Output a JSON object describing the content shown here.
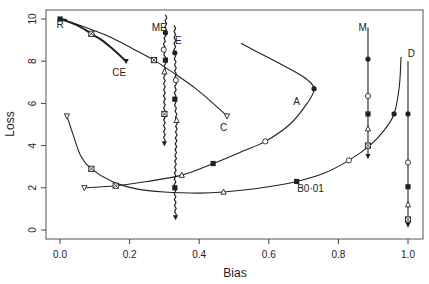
{
  "chart_data": {
    "type": "line",
    "title": "",
    "xlabel": "Bias",
    "ylabel": "Loss",
    "xlim": [
      -0.03,
      1.02
    ],
    "ylim": [
      -0.3,
      10.4
    ],
    "xticks": [
      "0.0",
      "0.2",
      "0.4",
      "0.6",
      "0.8",
      "1.0"
    ],
    "xtick_values": [
      0.0,
      0.2,
      0.4,
      0.6,
      0.8,
      1.0
    ],
    "yticks": [
      "0",
      "2",
      "4",
      "6",
      "8",
      "10"
    ],
    "ytick_values": [
      0,
      2,
      4,
      6,
      8,
      10
    ],
    "grid": false,
    "legend": "none (curves labelled inline)",
    "series": [
      {
        "name": "R",
        "label_pos": [
          0.0,
          9.75
        ],
        "points": [
          [
            0.0,
            10.0
          ],
          [
            0.01,
            9.98
          ],
          [
            0.02,
            9.95
          ]
        ]
      },
      {
        "name": "CE",
        "label_pos": [
          0.17,
          7.5
        ],
        "points": [
          [
            0.0,
            10.0
          ],
          [
            0.05,
            9.7
          ],
          [
            0.09,
            9.3
          ],
          [
            0.12,
            9.0
          ],
          [
            0.15,
            8.6
          ],
          [
            0.19,
            8.0
          ]
        ]
      },
      {
        "name": "C",
        "label_pos": [
          0.47,
          4.9
        ],
        "points": [
          [
            0.0,
            10.0
          ],
          [
            0.04,
            9.8
          ],
          [
            0.09,
            9.5
          ],
          [
            0.15,
            9.1
          ],
          [
            0.22,
            8.5
          ],
          [
            0.27,
            8.05
          ],
          [
            0.33,
            7.4
          ],
          [
            0.39,
            6.7
          ],
          [
            0.44,
            6.0
          ],
          [
            0.48,
            5.4
          ]
        ]
      },
      {
        "name": "ME",
        "label_pos": [
          0.285,
          9.6
        ],
        "points": [
          [
            0.305,
            10.2
          ],
          [
            0.303,
            9.35
          ],
          [
            0.298,
            8.55
          ],
          [
            0.303,
            8.05
          ],
          [
            0.3,
            7.5
          ],
          [
            0.3,
            5.5
          ],
          [
            0.3,
            4.1
          ]
        ]
      },
      {
        "name": "E",
        "label_pos": [
          0.34,
          9.0
        ],
        "points": [
          [
            0.33,
            9.7
          ],
          [
            0.33,
            8.4
          ],
          [
            0.333,
            7.1
          ],
          [
            0.33,
            6.2
          ],
          [
            0.335,
            5.2
          ],
          [
            0.33,
            2.0
          ],
          [
            0.332,
            0.6
          ]
        ]
      },
      {
        "name": "A",
        "label_pos": [
          0.68,
          6.1
        ],
        "points": [
          [
            0.07,
            2.0
          ],
          [
            0.16,
            2.1
          ],
          [
            0.25,
            2.3
          ],
          [
            0.35,
            2.6
          ],
          [
            0.44,
            3.15
          ],
          [
            0.52,
            3.7
          ],
          [
            0.59,
            4.2
          ],
          [
            0.66,
            5.0
          ],
          [
            0.71,
            6.0
          ],
          [
            0.73,
            6.7
          ],
          [
            0.7,
            7.25
          ],
          [
            0.63,
            7.9
          ],
          [
            0.56,
            8.5
          ],
          [
            0.52,
            8.85
          ]
        ]
      },
      {
        "name": "B0·01",
        "label_pos": [
          0.72,
          2.0
        ],
        "points": [
          [
            0.02,
            5.4
          ],
          [
            0.04,
            4.4
          ],
          [
            0.06,
            3.5
          ],
          [
            0.09,
            2.9
          ],
          [
            0.15,
            2.3
          ],
          [
            0.22,
            1.95
          ],
          [
            0.3,
            1.8
          ],
          [
            0.4,
            1.75
          ],
          [
            0.47,
            1.8
          ],
          [
            0.58,
            2.0
          ],
          [
            0.68,
            2.3
          ],
          [
            0.76,
            2.7
          ],
          [
            0.83,
            3.3
          ],
          [
            0.89,
            4.0
          ],
          [
            0.93,
            4.7
          ],
          [
            0.96,
            5.5
          ],
          [
            0.975,
            6.8
          ],
          [
            0.98,
            8.2
          ]
        ]
      },
      {
        "name": "M",
        "label_pos": [
          0.87,
          9.6
        ],
        "points": [
          [
            0.885,
            9.6
          ],
          [
            0.885,
            8.1
          ],
          [
            0.885,
            6.35
          ],
          [
            0.885,
            5.5
          ],
          [
            0.885,
            4.8
          ],
          [
            0.885,
            4.0
          ],
          [
            0.885,
            3.5
          ]
        ]
      },
      {
        "name": "D",
        "label_pos": [
          1.01,
          8.4
        ],
        "points": [
          [
            1.0,
            8.0
          ],
          [
            1.0,
            5.5
          ],
          [
            1.0,
            3.2
          ],
          [
            1.0,
            2.05
          ],
          [
            1.0,
            1.2
          ],
          [
            1.0,
            0.5
          ],
          [
            1.0,
            0.25
          ]
        ]
      }
    ],
    "markers": [
      {
        "series": "R",
        "shape": "filled-square",
        "x": 0.0,
        "y": 10.0
      },
      {
        "series": "CE",
        "shape": "crossed-square",
        "x": 0.09,
        "y": 9.3
      },
      {
        "series": "CE",
        "shape": "filled-down-triangle",
        "x": 0.19,
        "y": 8.0
      },
      {
        "series": "C",
        "shape": "crossed-square",
        "x": 0.27,
        "y": 8.05
      },
      {
        "series": "C",
        "shape": "open-down-triangle",
        "x": 0.48,
        "y": 5.4
      },
      {
        "series": "ME",
        "shape": "filled-circle",
        "x": 0.303,
        "y": 9.35
      },
      {
        "series": "ME",
        "shape": "open-circle",
        "x": 0.298,
        "y": 8.55
      },
      {
        "series": "ME",
        "shape": "filled-square",
        "x": 0.303,
        "y": 8.05
      },
      {
        "series": "ME",
        "shape": "open-triangle",
        "x": 0.3,
        "y": 7.5
      },
      {
        "series": "ME",
        "shape": "crossed-square",
        "x": 0.3,
        "y": 5.5
      },
      {
        "series": "ME",
        "shape": "filled-down-triangle",
        "x": 0.3,
        "y": 4.1
      },
      {
        "series": "E",
        "shape": "filled-circle",
        "x": 0.33,
        "y": 8.4
      },
      {
        "series": "E",
        "shape": "open-circle",
        "x": 0.333,
        "y": 7.1
      },
      {
        "series": "E",
        "shape": "filled-square",
        "x": 0.33,
        "y": 6.2
      },
      {
        "series": "E",
        "shape": "open-triangle",
        "x": 0.335,
        "y": 5.2
      },
      {
        "series": "E",
        "shape": "filled-square",
        "x": 0.33,
        "y": 2.0
      },
      {
        "series": "E",
        "shape": "filled-down-triangle",
        "x": 0.332,
        "y": 0.6
      },
      {
        "series": "A",
        "shape": "open-down-triangle",
        "x": 0.07,
        "y": 2.0
      },
      {
        "series": "A",
        "shape": "crossed-square",
        "x": 0.16,
        "y": 2.1
      },
      {
        "series": "A",
        "shape": "open-triangle",
        "x": 0.35,
        "y": 2.6
      },
      {
        "series": "A",
        "shape": "filled-square",
        "x": 0.44,
        "y": 3.15
      },
      {
        "series": "A",
        "shape": "open-circle",
        "x": 0.59,
        "y": 4.2
      },
      {
        "series": "A",
        "shape": "filled-circle",
        "x": 0.73,
        "y": 6.7
      },
      {
        "series": "B0·01",
        "shape": "open-down-triangle",
        "x": 0.02,
        "y": 5.4
      },
      {
        "series": "B0·01",
        "shape": "crossed-square",
        "x": 0.09,
        "y": 2.9
      },
      {
        "series": "B0·01",
        "shape": "open-triangle",
        "x": 0.47,
        "y": 1.8
      },
      {
        "series": "B0·01",
        "shape": "filled-square",
        "x": 0.68,
        "y": 2.3
      },
      {
        "series": "B0·01",
        "shape": "open-circle",
        "x": 0.83,
        "y": 3.3
      },
      {
        "series": "B0·01",
        "shape": "filled-circle",
        "x": 0.96,
        "y": 5.5
      },
      {
        "series": "M",
        "shape": "filled-circle",
        "x": 0.885,
        "y": 8.1
      },
      {
        "series": "M",
        "shape": "open-circle",
        "x": 0.885,
        "y": 6.35
      },
      {
        "series": "M",
        "shape": "filled-square",
        "x": 0.885,
        "y": 5.5
      },
      {
        "series": "M",
        "shape": "open-triangle",
        "x": 0.885,
        "y": 4.8
      },
      {
        "series": "M",
        "shape": "crossed-square",
        "x": 0.885,
        "y": 4.0
      },
      {
        "series": "M",
        "shape": "filled-down-triangle",
        "x": 0.885,
        "y": 3.5
      },
      {
        "series": "D",
        "shape": "filled-circle",
        "x": 1.0,
        "y": 5.5
      },
      {
        "series": "D",
        "shape": "open-circle",
        "x": 1.0,
        "y": 3.2
      },
      {
        "series": "D",
        "shape": "filled-square",
        "x": 1.0,
        "y": 2.05
      },
      {
        "series": "D",
        "shape": "open-triangle",
        "x": 1.0,
        "y": 1.2
      },
      {
        "series": "D",
        "shape": "crossed-square",
        "x": 1.0,
        "y": 0.5
      },
      {
        "series": "D",
        "shape": "filled-down-triangle",
        "x": 1.0,
        "y": 0.25
      }
    ]
  },
  "layout": {
    "plot_box": {
      "left": 46,
      "top": 10,
      "right": 423,
      "bottom": 239
    },
    "x0_px": 60,
    "x1_px": 408,
    "y0_px": 230,
    "y10_px": 19,
    "line_color": "#222222",
    "axis_color": "#444444"
  }
}
